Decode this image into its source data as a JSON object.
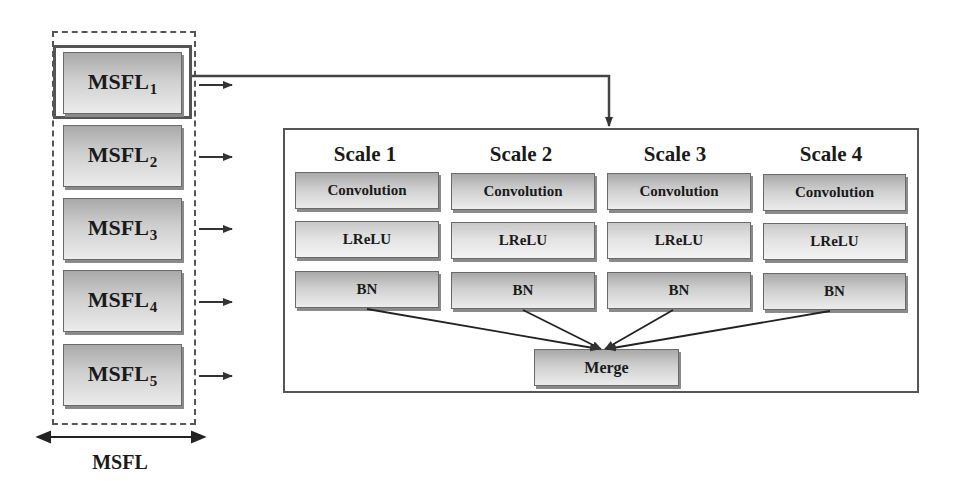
{
  "msfl_column": {
    "label": "MSFL",
    "items": [
      {
        "base": "MSFL",
        "sub": "1"
      },
      {
        "base": "MSFL",
        "sub": "2"
      },
      {
        "base": "MSFL",
        "sub": "3"
      },
      {
        "base": "MSFL",
        "sub": "4"
      },
      {
        "base": "MSFL",
        "sub": "5"
      }
    ]
  },
  "detail_block": {
    "scales": [
      {
        "title": "Scale 1",
        "layers": [
          "Convolution",
          "LReLU",
          "BN"
        ]
      },
      {
        "title": "Scale 2",
        "layers": [
          "Convolution",
          "LReLU",
          "BN"
        ]
      },
      {
        "title": "Scale 3",
        "layers": [
          "Convolution",
          "LReLU",
          "BN"
        ]
      },
      {
        "title": "Scale 4",
        "layers": [
          "Convolution",
          "LReLU",
          "BN"
        ]
      }
    ],
    "merge_label": "Merge"
  },
  "colors": {
    "line": "#333333",
    "box_border": "#6a6a6a",
    "box_gradient_top": "#a9a9a9",
    "box_gradient_bottom": "#ececec"
  }
}
